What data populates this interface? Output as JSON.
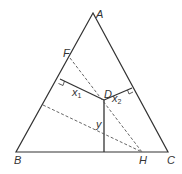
{
  "diagram": {
    "type": "geometry",
    "labels": {
      "A": "A",
      "B": "B",
      "C": "C",
      "D": "D",
      "F": "F",
      "H": "H",
      "x1": "x",
      "x1_sub": "1",
      "x2": "x",
      "x2_sub": "2",
      "y": "y"
    },
    "colors": {
      "line": "#333333",
      "dashed": "#555555"
    }
  }
}
